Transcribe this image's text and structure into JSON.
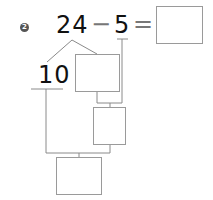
{
  "problem": {
    "number": "2",
    "minuend": "24",
    "operator": "−",
    "subtrahend": "5",
    "equals": "=",
    "answer": "",
    "decomposition": {
      "part_ten": "10",
      "part_other": ""
    },
    "step_box": "",
    "final_box": ""
  },
  "colors": {
    "ink": "#111111",
    "line": "#8a8a8a",
    "badge": "#555555"
  }
}
